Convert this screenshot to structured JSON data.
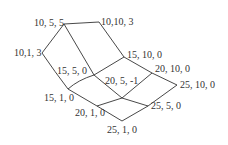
{
  "diagram": {
    "type": "lattice-graph",
    "line_color": "#333333",
    "nodes": [
      {
        "id": "n10_5_5",
        "label": "10, 5, 5",
        "x": 64,
        "y": 24
      },
      {
        "id": "n10_10_3",
        "label": "10,10, 3",
        "x": 99,
        "y": 22
      },
      {
        "id": "n10_1_3",
        "label": "10,1, 3",
        "x": 42,
        "y": 53
      },
      {
        "id": "n15_10_0",
        "label": "15, 10, 0",
        "x": 124,
        "y": 57
      },
      {
        "id": "n15_5_0",
        "label": "15, 5, 0",
        "x": 94,
        "y": 75
      },
      {
        "id": "n20_10_0",
        "label": "20, 10, 0",
        "x": 152,
        "y": 73
      },
      {
        "id": "n20_5_m1",
        "label": "20, 5, -1",
        "x": 122,
        "y": 98
      },
      {
        "id": "n15_1_0",
        "label": "15, 1, 0",
        "x": 68,
        "y": 89
      },
      {
        "id": "n25_10_0",
        "label": "25, 10, 0",
        "x": 177,
        "y": 85
      },
      {
        "id": "n20_1_0",
        "label": "20, 1, 0",
        "x": 97,
        "y": 106
      },
      {
        "id": "n25_5_0",
        "label": "25, 5, 0",
        "x": 148,
        "y": 106
      },
      {
        "id": "n25_1_0",
        "label": "25, 1, 0",
        "x": 122,
        "y": 121
      }
    ],
    "edges": [
      [
        "n10_5_5",
        "n10_10_3"
      ],
      [
        "n10_5_5",
        "n10_1_3"
      ],
      [
        "n10_5_5",
        "n15_5_0"
      ],
      [
        "n10_10_3",
        "n15_10_0"
      ],
      [
        "n10_1_3",
        "n15_1_0"
      ],
      [
        "n15_10_0",
        "n15_5_0"
      ],
      [
        "n15_10_0",
        "n20_10_0"
      ],
      [
        "n15_5_0",
        "n15_1_0"
      ],
      [
        "n15_5_0",
        "n20_5_m1"
      ],
      [
        "n20_10_0",
        "n20_5_m1"
      ],
      [
        "n20_10_0",
        "n25_10_0"
      ],
      [
        "n15_1_0",
        "n20_1_0"
      ],
      [
        "n20_5_m1",
        "n20_1_0"
      ],
      [
        "n20_5_m1",
        "n25_5_0"
      ],
      [
        "n25_10_0",
        "n25_5_0"
      ],
      [
        "n20_1_0",
        "n25_1_0"
      ],
      [
        "n25_5_0",
        "n25_1_0"
      ]
    ]
  }
}
